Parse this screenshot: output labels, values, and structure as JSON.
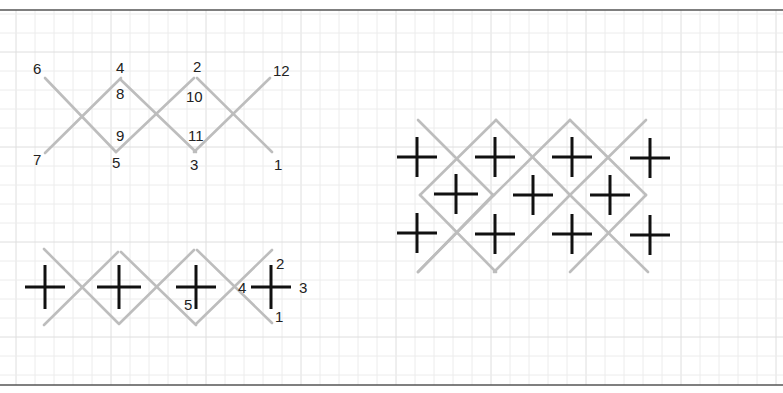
{
  "colors": {
    "background": "#ffffff",
    "grid_minor": "#ececec",
    "grid_major": "#dedede",
    "border": "#555555",
    "thread": "#bdbdbd",
    "cross": "#111111",
    "label": "#222222"
  },
  "grid": {
    "spacing": 19,
    "major_every": 5,
    "origin_x": 16,
    "origin_y": 14
  },
  "frame": {
    "top_y": 10,
    "bottom_y": 385
  },
  "diagram_top": {
    "title": "Cross-stitch row stitching order (numbered)",
    "threads": [
      [
        45,
        78,
        116,
        152
      ],
      [
        45,
        153,
        121,
        78
      ],
      [
        121,
        80,
        196,
        152
      ],
      [
        116,
        152,
        194,
        78
      ],
      [
        197,
        78,
        272,
        152
      ],
      [
        194,
        152,
        270,
        78
      ]
    ],
    "labels": [
      {
        "text": "6",
        "x": 33,
        "y": 74
      },
      {
        "text": "4",
        "x": 116,
        "y": 73
      },
      {
        "text": "2",
        "x": 193,
        "y": 72
      },
      {
        "text": "12",
        "x": 273,
        "y": 76
      },
      {
        "text": "8",
        "x": 116,
        "y": 99
      },
      {
        "text": "10",
        "x": 186,
        "y": 102
      },
      {
        "text": "9",
        "x": 116,
        "y": 141
      },
      {
        "text": "11",
        "x": 188,
        "y": 141
      },
      {
        "text": "7",
        "x": 33,
        "y": 165
      },
      {
        "text": "5",
        "x": 112,
        "y": 168
      },
      {
        "text": "3",
        "x": 190,
        "y": 170
      },
      {
        "text": "1",
        "x": 274,
        "y": 170
      }
    ]
  },
  "diagram_bottom_left": {
    "title": "Row of crosses with threads",
    "threads": [
      [
        44,
        249,
        118,
        323
      ],
      [
        44,
        325,
        118,
        252
      ],
      [
        121,
        252,
        196,
        325
      ],
      [
        119,
        324,
        194,
        250
      ],
      [
        197,
        250,
        272,
        323
      ],
      [
        196,
        324,
        272,
        250
      ]
    ],
    "crosses": [
      {
        "cx": 45,
        "cy": 287,
        "h": 20,
        "v": 22
      },
      {
        "cx": 119,
        "cy": 287,
        "h": 22,
        "v": 22
      },
      {
        "cx": 196,
        "cy": 287,
        "h": 20,
        "v": 22
      },
      {
        "cx": 271,
        "cy": 287,
        "h": 20,
        "v": 22
      }
    ],
    "labels": [
      {
        "text": "2",
        "x": 276,
        "y": 269
      },
      {
        "text": "3",
        "x": 299,
        "y": 293
      },
      {
        "text": "4",
        "x": 238,
        "y": 293
      },
      {
        "text": "5",
        "x": 184,
        "y": 310
      },
      {
        "text": "1",
        "x": 275,
        "y": 322
      }
    ]
  },
  "diagram_right": {
    "title": "Diamond lattice of crosses",
    "threads": [
      [
        418,
        120,
        493,
        195
      ],
      [
        493,
        195,
        418,
        272
      ],
      [
        420,
        195,
        496,
        120
      ],
      [
        496,
        120,
        570,
        195
      ],
      [
        420,
        195,
        496,
        272
      ],
      [
        494,
        195,
        570,
        120
      ],
      [
        570,
        120,
        646,
        195
      ],
      [
        494,
        195,
        418,
        272
      ],
      [
        570,
        195,
        646,
        120
      ],
      [
        570,
        195,
        494,
        272
      ],
      [
        570,
        195,
        648,
        272
      ],
      [
        646,
        195,
        570,
        272
      ]
    ],
    "crosses": [
      {
        "cx": 417,
        "cy": 157,
        "h": 20,
        "v": 20
      },
      {
        "cx": 495,
        "cy": 157,
        "h": 20,
        "v": 20
      },
      {
        "cx": 572,
        "cy": 157,
        "h": 20,
        "v": 20
      },
      {
        "cx": 650,
        "cy": 158,
        "h": 20,
        "v": 20
      },
      {
        "cx": 456,
        "cy": 194,
        "h": 22,
        "v": 20
      },
      {
        "cx": 533,
        "cy": 195,
        "h": 20,
        "v": 20
      },
      {
        "cx": 610,
        "cy": 195,
        "h": 20,
        "v": 20
      },
      {
        "cx": 417,
        "cy": 233,
        "h": 20,
        "v": 20
      },
      {
        "cx": 495,
        "cy": 234,
        "h": 20,
        "v": 20
      },
      {
        "cx": 572,
        "cy": 234,
        "h": 20,
        "v": 20
      },
      {
        "cx": 650,
        "cy": 235,
        "h": 20,
        "v": 20
      }
    ]
  }
}
